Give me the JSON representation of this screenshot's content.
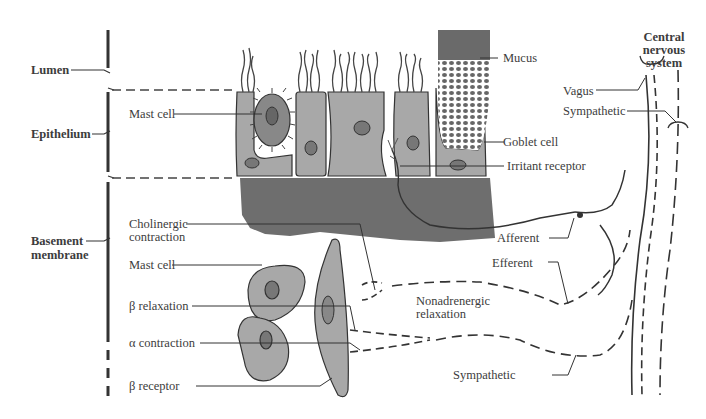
{
  "layers": {
    "lumen": "Lumen",
    "epithelium": "Epithelium",
    "basement_line1": "Basement",
    "basement_line2": "membrane"
  },
  "labels": {
    "mast_cell_top": "Mast cell",
    "cholinergic_line1": "Cholinergic",
    "cholinergic_line2": "contraction",
    "mast_cell_bottom": "Mast cell",
    "beta_relaxation": "β relaxation",
    "alpha_contraction": "α contraction",
    "beta_receptor": "β receptor",
    "mucus": "Mucus",
    "goblet_cell": "Goblet cell",
    "irritant_receptor": "Irritant receptor",
    "afferent": "Afferent",
    "efferent": "Efferent",
    "nonadrenergic_line1": "Nonadrenergic",
    "nonadrenergic_line2": "relaxation",
    "sympathetic_bottom": "Sympathetic",
    "vagus": "Vagus",
    "sympathetic_top": "Sympathetic",
    "cns_line1": "Central",
    "cns_line2": "nervous",
    "cns_line3": "system"
  },
  "colors": {
    "cell_fill": "#a8a8a8",
    "basement_fill": "#6e6e6e",
    "line": "#3a3a3a",
    "mucus": "#6a6a6a"
  }
}
